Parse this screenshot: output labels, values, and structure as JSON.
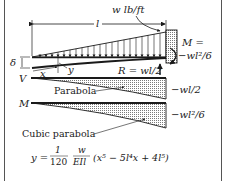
{
  "diagram": {
    "type": "cantilever-beam-triangular-load",
    "load_label": "w lb/ft",
    "length_label": "l",
    "deflection_label": "δ",
    "x_label": "x",
    "y_label": "y",
    "reaction_label": "R = wl/2",
    "moment_label_line1": "M =",
    "moment_label_line2": "−wl²/6",
    "shear_axis_label": "V",
    "moment_axis_label": "M",
    "shear_curve_label": "Parabola",
    "shear_end_value": "−wl/2",
    "moment_curve_label": "Cubic parabola",
    "moment_end_value": "−wl²/6",
    "formula": {
      "lhs": "y =",
      "frac1_num": "1",
      "frac1_den": "120",
      "frac2_num": "w",
      "frac2_den": "EIl",
      "rhs": "(x⁵ − 5l⁴x + 4l⁵)"
    },
    "colors": {
      "ink": "#1a1a1a",
      "hatch": "#9a9a9a",
      "frame": "#555555"
    }
  }
}
